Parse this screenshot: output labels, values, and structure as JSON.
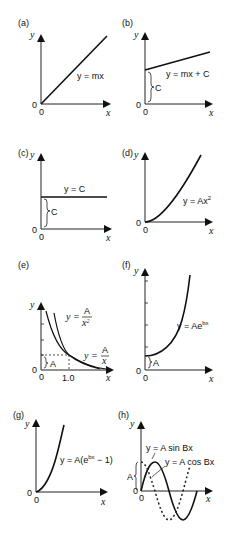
{
  "figure": {
    "panels": [
      {
        "id": "a",
        "label": "(a)",
        "equation": "y = mx",
        "x_axis": "x",
        "y_axis": "y",
        "origin_x": "0",
        "origin_y": "0"
      },
      {
        "id": "b",
        "label": "(b)",
        "equation": "y = mx + C",
        "intercept_label": "C",
        "x_axis": "x",
        "y_axis": "y",
        "origin_x": "0",
        "origin_y": "0"
      },
      {
        "id": "c",
        "label": "(c)",
        "equation": "y = C",
        "intercept_label": "C",
        "x_axis": "x",
        "y_axis": "y",
        "origin_x": "0",
        "origin_y": "0"
      },
      {
        "id": "d",
        "label": "(d)",
        "equation_prefix": "y = Ax",
        "equation_sup": "2",
        "x_axis": "x",
        "y_axis": "y",
        "origin_x": "0",
        "origin_y": "0"
      },
      {
        "id": "e",
        "label": "(e)",
        "eq1_lhs": "y =",
        "eq1_num": "A",
        "eq1_den": "x",
        "eq1_den_sup": "2",
        "eq2_lhs": "y =",
        "eq2_num": "A",
        "eq2_den": "x",
        "intercept_label": "A",
        "x_tick": "1.0",
        "x_axis": "x",
        "y_axis": "y",
        "origin_x": "0",
        "origin_y": "0"
      },
      {
        "id": "f",
        "label": "(f)",
        "equation_prefix": "y = Ae",
        "equation_sup": "bx",
        "intercept_label": "A",
        "x_axis": "x",
        "y_axis": "y",
        "origin_x": "0",
        "origin_y": "0"
      },
      {
        "id": "g",
        "label": "(g)",
        "equation_prefix": "y = A(e",
        "equation_sup": "bx",
        "equation_suffix": " − 1)",
        "x_axis": "x",
        "y_axis": "y",
        "origin_x": "0",
        "origin_y": "0"
      },
      {
        "id": "h",
        "label": "(h)",
        "eq_sin": "y = A sin Bx",
        "eq_cos": "y = A cos Bx",
        "amplitude_label": "A",
        "x_axis": "x",
        "y_axis": "y",
        "origin_x": "0",
        "origin_y": "0"
      }
    ]
  }
}
